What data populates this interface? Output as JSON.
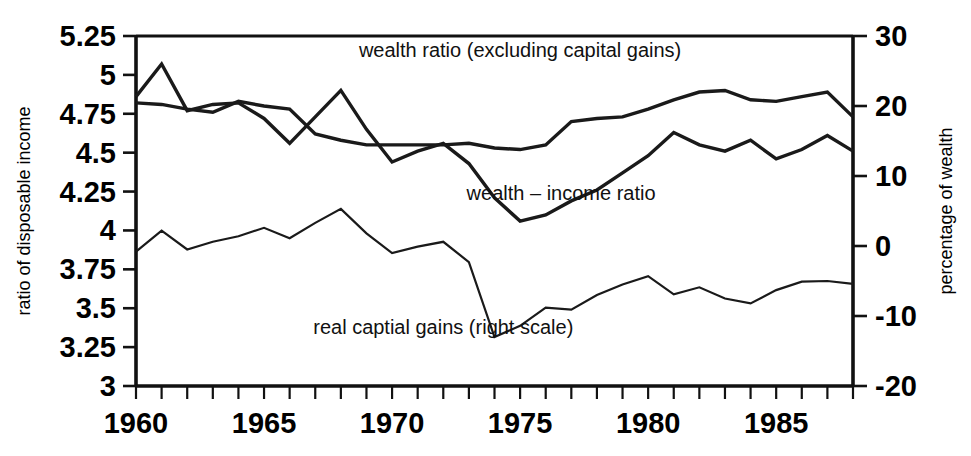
{
  "chart_data": {
    "type": "line",
    "title": "",
    "xlabel": "",
    "ylabel": "ratio of disposable income",
    "y2label": "percentage of wealth",
    "grid": false,
    "legend_position": "inline-annotations",
    "x": [
      1960,
      1961,
      1962,
      1963,
      1964,
      1965,
      1966,
      1967,
      1968,
      1969,
      1970,
      1971,
      1972,
      1973,
      1974,
      1975,
      1976,
      1977,
      1978,
      1979,
      1980,
      1981,
      1982,
      1983,
      1984,
      1985,
      1986,
      1987,
      1988
    ],
    "xlim": [
      1960,
      1988
    ],
    "xticks_major": [
      1960,
      1965,
      1970,
      1975,
      1980,
      1985
    ],
    "xtick_labels": [
      "1960",
      "1965",
      "1970",
      "1975",
      "1980",
      "1985"
    ],
    "ylim": [
      3,
      5.25
    ],
    "yticks": [
      3,
      3.25,
      3.5,
      3.75,
      4,
      4.25,
      4.5,
      4.75,
      5,
      5.25
    ],
    "ytick_labels": [
      "3",
      "3.25",
      "3.5",
      "3.75",
      "4",
      "4.25",
      "4.5",
      "4.75",
      "5",
      "5.25"
    ],
    "y2lim": [
      -20,
      30
    ],
    "y2ticks": [
      -20,
      -10,
      0,
      10,
      20,
      30
    ],
    "y2tick_labels": [
      "-20",
      "-10",
      "0",
      "10",
      "20",
      "30"
    ],
    "series": [
      {
        "name": "wealth ratio (excluding capital gains)",
        "axis": "left",
        "label_text": "wealth ratio (excluding capital gains)",
        "label_x": 1975.0,
        "label_y": 5.115,
        "stroke_width": "thick",
        "values": [
          4.82,
          4.81,
          4.78,
          4.76,
          4.83,
          4.8,
          4.78,
          4.62,
          4.58,
          4.55,
          4.55,
          4.55,
          4.55,
          4.56,
          4.53,
          4.52,
          4.55,
          4.7,
          4.72,
          4.73,
          4.78,
          4.84,
          4.89,
          4.9,
          4.84,
          4.83,
          4.86,
          4.89,
          4.73
        ]
      },
      {
        "name": "wealth - income ratio",
        "axis": "left",
        "label_text": "wealth – income ratio",
        "label_x": 1976.6,
        "label_y": 4.195,
        "stroke_width": "thick",
        "values": [
          4.86,
          5.07,
          4.77,
          4.81,
          4.82,
          4.72,
          4.56,
          4.73,
          4.9,
          4.65,
          4.44,
          4.51,
          4.56,
          4.43,
          4.21,
          4.06,
          4.1,
          4.19,
          4.26,
          4.37,
          4.48,
          4.63,
          4.55,
          4.51,
          4.58,
          4.46,
          4.52,
          4.61,
          4.51
        ]
      },
      {
        "name": "real captial gains (right scale)",
        "axis": "right",
        "label_text": "real captial gains (right scale)",
        "label_x": 1972.0,
        "label_y": 3.335,
        "stroke_width": "thin",
        "values": [
          -0.8,
          2.2,
          -0.5,
          0.6,
          1.4,
          2.6,
          1.1,
          3.3,
          5.3,
          1.8,
          -1.0,
          -0.1,
          0.6,
          -2.3,
          -13.0,
          -11.4,
          -8.8,
          -9.1,
          -7.0,
          -5.5,
          -4.3,
          -6.9,
          -5.9,
          -7.5,
          -8.2,
          -6.3,
          -5.1,
          -5.0,
          -5.4
        ]
      }
    ]
  },
  "axes": {
    "left_title": "ratio of disposable income",
    "right_title": "percentage of wealth"
  }
}
